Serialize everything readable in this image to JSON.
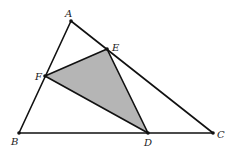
{
  "diagram": {
    "type": "geometry-triangle",
    "points": {
      "A": {
        "label": "A",
        "x": 71,
        "y": 21,
        "lx": 65,
        "ly": 17
      },
      "B": {
        "label": "B",
        "x": 19,
        "y": 133,
        "lx": 11,
        "ly": 145
      },
      "C": {
        "label": "C",
        "x": 213,
        "y": 133,
        "lx": 217,
        "ly": 138
      },
      "D": {
        "label": "D",
        "x": 148,
        "y": 133,
        "lx": 144,
        "ly": 146
      },
      "E": {
        "label": "E",
        "x": 107,
        "y": 49,
        "lx": 112,
        "ly": 51
      },
      "F": {
        "label": "F",
        "x": 45,
        "y": 76,
        "lx": 35,
        "ly": 80
      }
    },
    "segments": [
      [
        "A",
        "B"
      ],
      [
        "B",
        "C"
      ],
      [
        "A",
        "C"
      ]
    ],
    "shaded_triangle": [
      "D",
      "E",
      "F"
    ],
    "colors": {
      "stroke": "#111111",
      "shade": "#b5b5b5",
      "background": "#ffffff"
    }
  }
}
